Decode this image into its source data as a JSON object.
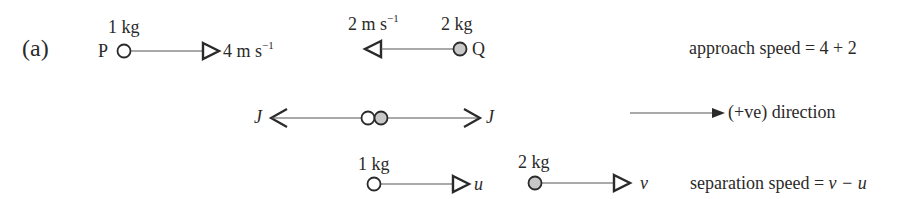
{
  "figure": {
    "part_label": "(a)",
    "colors": {
      "ink": "#2a2a2a",
      "line": "#555555",
      "ball_light": "#ffffff",
      "ball_dark": "#c8c8c8",
      "background": "#ffffff"
    }
  },
  "before": {
    "particle_p": {
      "name": "P",
      "mass": "1 kg",
      "velocity": "4 m s",
      "velocity_exp": "−1",
      "direction": "right"
    },
    "particle_q": {
      "name": "Q",
      "mass": "2 kg",
      "velocity": "2 m s",
      "velocity_exp": "−1",
      "direction": "left"
    },
    "approach_speed": "approach speed = 4 + 2"
  },
  "impact": {
    "impulse_left": "J",
    "impulse_right": "J",
    "positive_direction": "(+ve) direction"
  },
  "after": {
    "particle_p": {
      "mass": "1 kg",
      "velocity": "u"
    },
    "particle_q": {
      "mass": "2 kg",
      "velocity": "v"
    },
    "separation_speed_prefix": "separation speed = ",
    "separation_speed_expr": "v − u"
  }
}
